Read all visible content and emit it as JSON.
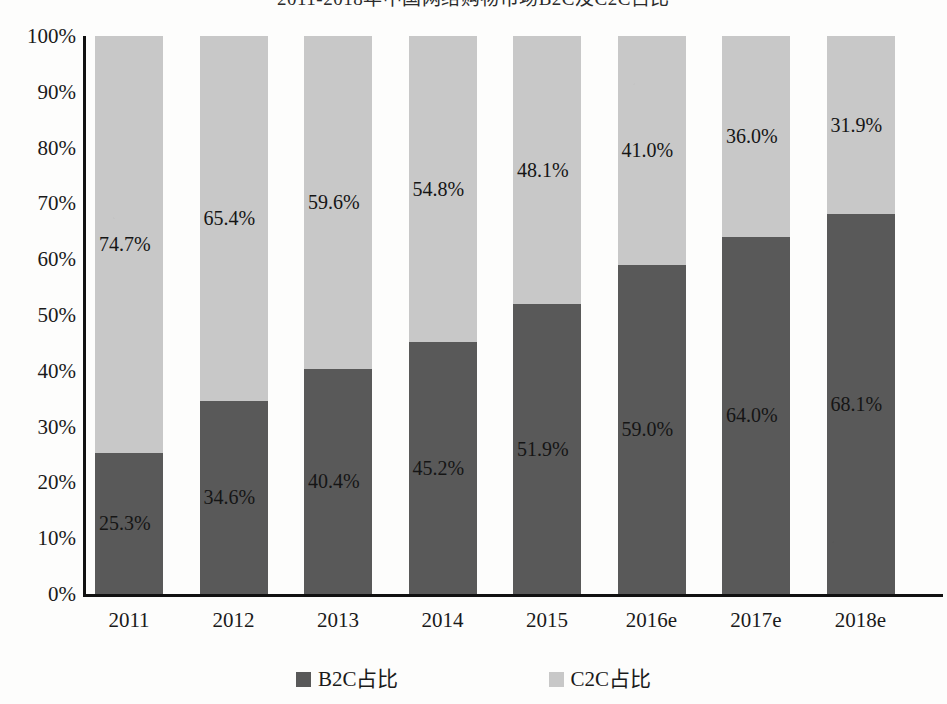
{
  "title": "2011-2018年中国网络购物市场B2C及C2C占比",
  "legend": {
    "position": "bottom-center",
    "items": [
      {
        "label": "B2C占比",
        "color": "#595959",
        "swatch_name": "legend-swatch-b2c"
      },
      {
        "label": "C2C占比",
        "color": "#c8c8c8",
        "swatch_name": "legend-swatch-c2c"
      }
    ]
  },
  "y_axis": {
    "ticks": [
      "0%",
      "10%",
      "20%",
      "30%",
      "40%",
      "50%",
      "60%",
      "70%",
      "80%",
      "90%",
      "100%"
    ],
    "min": 0,
    "max": 100
  },
  "chart_data": {
    "type": "bar",
    "stacked": true,
    "stack_total": 100,
    "title": "2011-2018年中国网络购物市场B2C及C2C占比",
    "xlabel": "",
    "ylabel": "",
    "ylim": [
      0,
      100
    ],
    "ytick_labels": [
      "0%",
      "10%",
      "20%",
      "30%",
      "40%",
      "50%",
      "60%",
      "70%",
      "80%",
      "90%",
      "100%"
    ],
    "grid": false,
    "legend_position": "bottom-center",
    "categories": [
      "2011",
      "2012",
      "2013",
      "2014",
      "2015",
      "2016e",
      "2017e",
      "2018e"
    ],
    "series": [
      {
        "name": "B2C占比",
        "color": "#595959",
        "values": [
          25.3,
          34.6,
          40.4,
          45.2,
          51.9,
          59.0,
          64.0,
          68.1
        ],
        "labels": [
          "25.3%",
          "34.6%",
          "40.4%",
          "45.2%",
          "51.9%",
          "59.0%",
          "64.0%",
          "68.1%"
        ]
      },
      {
        "name": "C2C占比",
        "color": "#c8c8c8",
        "values": [
          74.7,
          65.4,
          59.6,
          54.8,
          48.1,
          41.0,
          36.0,
          31.9
        ],
        "labels": [
          "74.7%",
          "65.4%",
          "59.6%",
          "54.8%",
          "48.1%",
          "41.0%",
          "36.0%",
          "31.9%"
        ]
      }
    ]
  }
}
